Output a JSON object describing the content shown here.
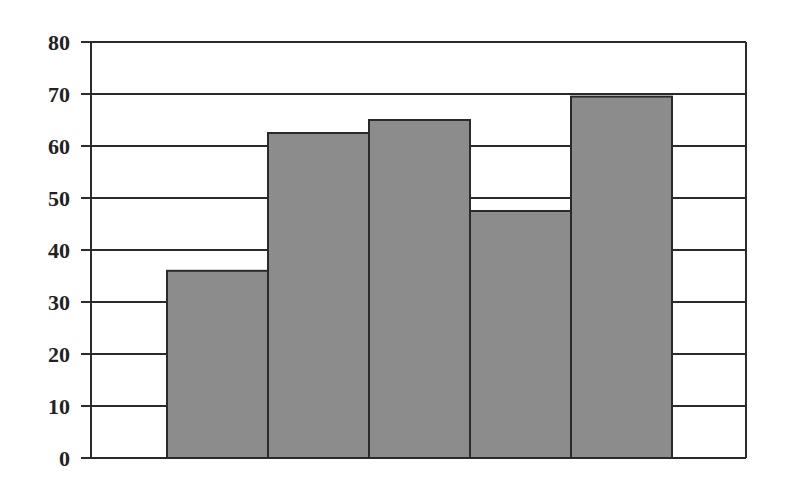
{
  "chart_data": {
    "type": "bar",
    "title": "",
    "xlabel": "",
    "ylabel": "",
    "categories": [
      "",
      "",
      "",
      "",
      ""
    ],
    "values": [
      36,
      62.5,
      65,
      47.5,
      69.5
    ],
    "ylim": [
      0,
      80
    ],
    "yticks": [
      "0",
      "10",
      "20",
      "30",
      "40",
      "50",
      "60",
      "70",
      "80"
    ],
    "grid": true,
    "legend": null,
    "bar_color": "#8c8c8c",
    "edge_color": "#2a2a2a"
  }
}
